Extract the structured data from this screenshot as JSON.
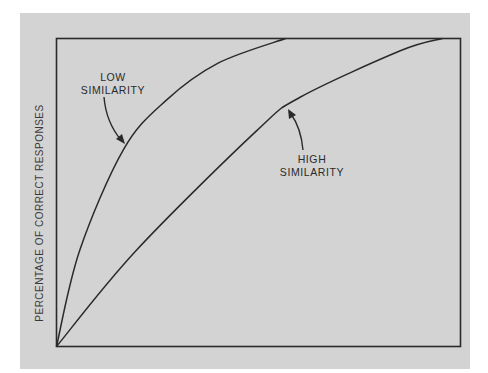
{
  "chart_data": {
    "type": "line",
    "title": "",
    "xlabel": "",
    "ylabel": "PERCENTAGE OF CORRECT RESPONSES",
    "xlim": [
      0,
      1
    ],
    "ylim": [
      0,
      100
    ],
    "grid": false,
    "legend": "none (curves labeled directly with arrows)",
    "series": [
      {
        "name": "LOW SIMILARITY",
        "label_lines": [
          "LOW",
          "SIMILARITY"
        ],
        "x": [
          0,
          0.057,
          0.166,
          0.272,
          0.4,
          0.567
        ],
        "y": [
          0,
          31,
          64,
          80,
          92,
          100
        ]
      },
      {
        "name": "HIGH SIMILARITY",
        "label_lines": [
          "HIGH",
          "SIMILARITY"
        ],
        "x": [
          0,
          0.196,
          0.495,
          0.604,
          0.851,
          0.955
        ],
        "y": [
          0,
          31,
          70,
          81,
          96,
          100
        ]
      }
    ],
    "annotations": [
      {
        "text": "LOW SIMILARITY",
        "arrow_to_series": "LOW SIMILARITY"
      },
      {
        "text": "HIGH SIMILARITY",
        "arrow_to_series": "HIGH SIMILARITY"
      }
    ]
  },
  "colors": {
    "panel": "#d3d3d3",
    "ink": "#2a2a2a",
    "page": "#ffffff"
  }
}
